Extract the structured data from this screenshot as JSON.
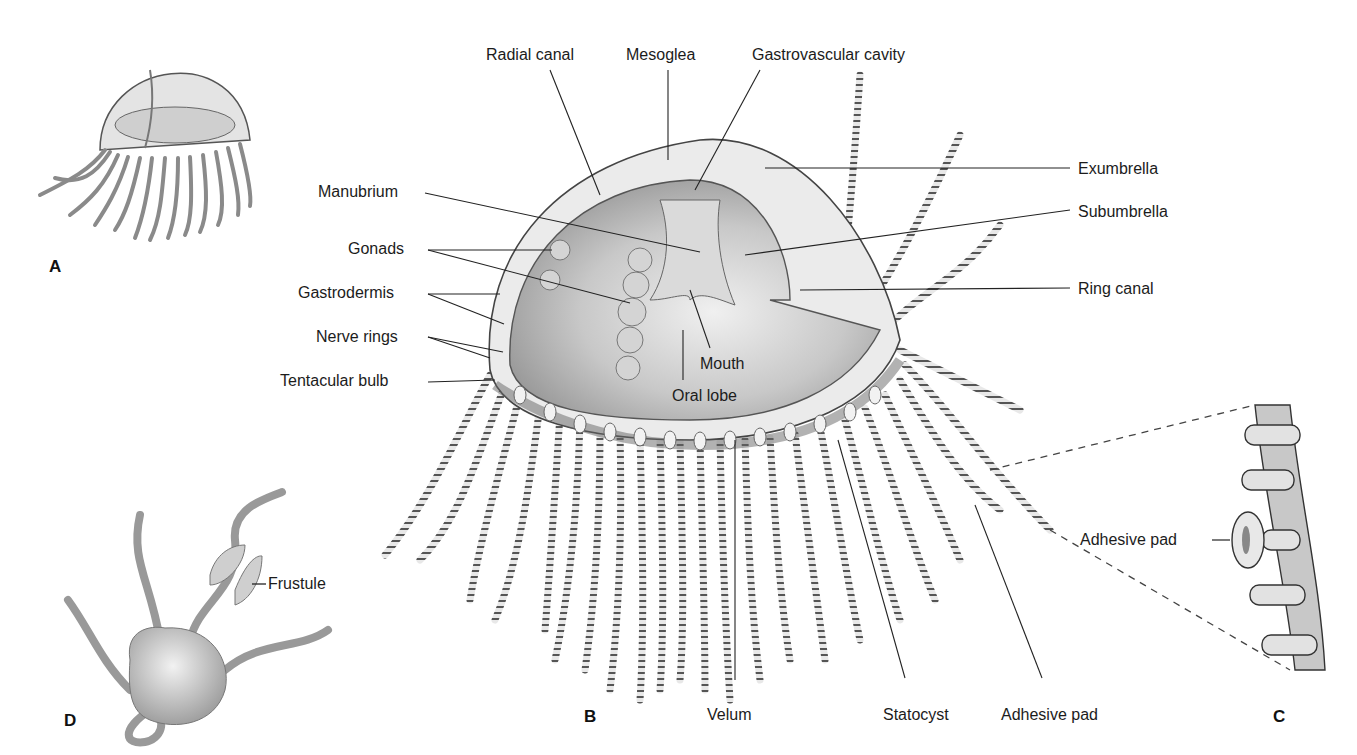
{
  "figure": {
    "panels": {
      "a": "A",
      "b": "B",
      "c": "C",
      "d": "D"
    },
    "labels": {
      "radial_canal": "Radial canal",
      "mesoglea": "Mesoglea",
      "gastrovascular_cavity": "Gastrovascular cavity",
      "manubrium": "Manubrium",
      "gonads": "Gonads",
      "gastrodermis": "Gastrodermis",
      "nerve_rings": "Nerve rings",
      "tentacular_bulb": "Tentacular bulb",
      "mouth": "Mouth",
      "oral_lobe": "Oral lobe",
      "exumbrella": "Exumbrella",
      "subumbrella": "Subumbrella",
      "ring_canal": "Ring canal",
      "velum": "Velum",
      "statocyst": "Statocyst",
      "adhesive_pad_b": "Adhesive pad",
      "adhesive_pad_c": "Adhesive pad",
      "frustule": "Frustule"
    },
    "colors": {
      "ink": "#1a1a1a",
      "body_fill": "#d9d9d9",
      "body_dark": "#a8a8a8",
      "mesoglea": "#ececec",
      "tentacle": "#e6e6e6"
    }
  }
}
